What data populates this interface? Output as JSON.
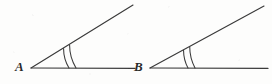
{
  "figure": {
    "background_color": "#fdfdfc",
    "stroke_color": "#3a3a3a",
    "label_color": "#2b2b2b"
  },
  "angles": [
    {
      "id": "angle-A",
      "vertex_label": "A",
      "vertex": {
        "x": 31,
        "y": 68
      },
      "initial_ray_end": {
        "x": 135,
        "y": 68
      },
      "terminal_ray_end": {
        "x": 133,
        "y": 5
      },
      "measure_degrees": 31,
      "tick_marks": 2,
      "arc_radii": [
        38,
        45
      ]
    },
    {
      "id": "angle-B",
      "vertex_label": "B",
      "vertex": {
        "x": 150,
        "y": 68
      },
      "initial_ray_end": {
        "x": 268,
        "y": 68
      },
      "terminal_ray_end": {
        "x": 264,
        "y": 6
      },
      "measure_degrees": 28,
      "tick_marks": 2,
      "arc_radii": [
        38,
        45
      ]
    }
  ],
  "chart_data": {
    "type": "diagram",
    "elements": [
      {
        "kind": "angle",
        "label": "A",
        "arcs": 2,
        "degrees": 31
      },
      {
        "kind": "angle",
        "label": "B",
        "arcs": 2,
        "degrees": 28
      }
    ],
    "annotations": [
      "A",
      "B"
    ]
  }
}
